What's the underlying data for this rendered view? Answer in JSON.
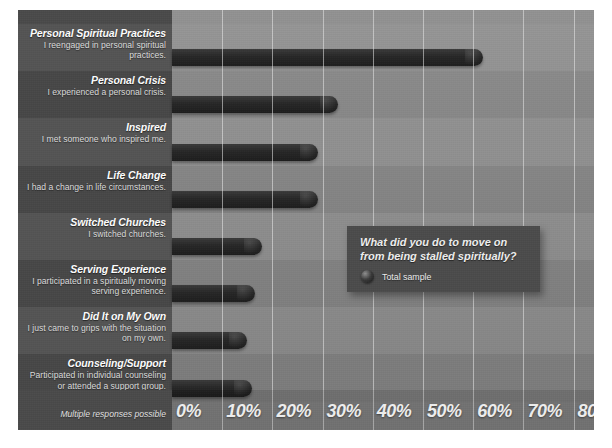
{
  "chart_data": {
    "type": "bar",
    "orientation": "horizontal",
    "title": "What did you do to move on from being stalled spiritually?",
    "xlabel": "",
    "ylabel": "",
    "xlim": [
      0,
      80
    ],
    "grid": true,
    "legend_position": "callout-box",
    "footnote": "Multiple responses possible",
    "tick_labels": [
      "0%",
      "10%",
      "20%",
      "30%",
      "40%",
      "50%",
      "60%",
      "70%",
      "80%"
    ],
    "tick_values": [
      0,
      10,
      20,
      30,
      40,
      50,
      60,
      70,
      80
    ],
    "series": [
      {
        "name": "Total sample",
        "values": [
          62,
          33,
          29,
          29,
          18,
          16.5,
          15,
          16
        ]
      }
    ],
    "categories": [
      "Personal Spiritual Practices",
      "Personal Crisis",
      "Inspired",
      "Life Change",
      "Switched Churches",
      "Serving Experience",
      "Did It on My Own",
      "Counseling/Support"
    ],
    "category_descriptions": [
      "I reengaged in personal spiritual practices.",
      "I experienced a personal crisis.",
      "I met someone who inspired me.",
      "I had a change in life circumstances.",
      "I switched churches.",
      "I participated in a spiritually moving serving experience.",
      "I just came to grips with the situation on my own.",
      "Participated in individual counseling or attended a support group."
    ]
  },
  "rows": [
    {
      "title": "Personal Spiritual Practices",
      "sub": "I reengaged in personal spiritual practices.",
      "value": 62
    },
    {
      "title": "Personal Crisis",
      "sub": "I experienced a personal crisis.",
      "value": 33
    },
    {
      "title": "Inspired",
      "sub": "I met someone who inspired me.",
      "value": 29
    },
    {
      "title": "Life Change",
      "sub": "I had a change in life circumstances.",
      "value": 29
    },
    {
      "title": "Switched Churches",
      "sub": "I switched churches.",
      "value": 18
    },
    {
      "title": "Serving Experience",
      "sub": "I participated in a spiritually moving serving experience.",
      "value": 16.5
    },
    {
      "title": "Did It on My Own",
      "sub": "I just came to grips with the situation on my own.",
      "value": 15
    },
    {
      "title": "Counseling/Support",
      "sub": "Participated in individual counseling or attended a support group.",
      "value": 16
    }
  ],
  "axis": {
    "ticks": [
      "0%",
      "10%",
      "20%",
      "30%",
      "40%",
      "50%",
      "60%",
      "70%",
      "80%"
    ],
    "footnote": "Multiple responses possible"
  },
  "callout": {
    "question_line1": "What did you do to move on",
    "question_line2": "from being stalled spiritually?",
    "legend_label": "Total sample"
  },
  "colors": {
    "background": "#ffffff",
    "plot_area": "#8c8c8c",
    "label_panel": "#4a4a4a",
    "bar": "#262626",
    "gridline": "#ebebeb",
    "callout_box": "#4b4b4b",
    "tick_text": "#efefef"
  }
}
